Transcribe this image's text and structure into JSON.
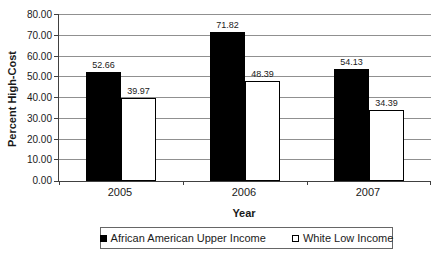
{
  "colors": {
    "text": "#1a1a1a",
    "axis": "#404040",
    "gridline": "#909090",
    "bar_border": "#000000",
    "legend_border": "#666666"
  },
  "chart_data": {
    "type": "bar",
    "title": "",
    "categories": [
      "2005",
      "2006",
      "2007"
    ],
    "series": [
      {
        "name": "African American Upper Income",
        "color": "#000000",
        "values": [
          52.66,
          71.82,
          54.13
        ]
      },
      {
        "name": "White Low Income",
        "color": "#ffffff",
        "values": [
          39.97,
          48.39,
          34.39
        ]
      }
    ],
    "xlabel": "Year",
    "ylabel": "Percent High-Cost",
    "ylim": [
      0,
      80
    ],
    "ytick_step": 10,
    "ytick_labels": [
      "0.00",
      "10.00",
      "20.00",
      "30.00",
      "40.00",
      "50.00",
      "60.00",
      "70.00",
      "80.00"
    ],
    "value_label_decimals": 2,
    "grid": true,
    "data_labels": true,
    "legend_position": "bottom"
  }
}
